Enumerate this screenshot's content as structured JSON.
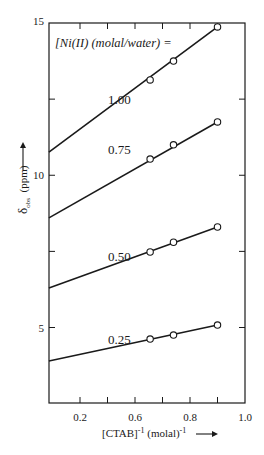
{
  "chart_data": {
    "type": "line",
    "title": "",
    "legend_title": "[Ni(II) (molal/water) =",
    "xlabel": "[CTAB]⁻¹ (molal)⁻¹",
    "xlabel_parts": {
      "main": "[CTAB]",
      "sup1": "-1",
      "unit": " (molal)",
      "sup2": "-1",
      "arrow": "→"
    },
    "ylabel": "δobs (ppm)",
    "ylabel_parts": {
      "symbol": "δ",
      "sub": "obs",
      "unit": " (ppm)",
      "arrow": "→"
    },
    "xlim": [
      0.287,
      1.0
    ],
    "ylim": [
      2.53,
      15
    ],
    "x_ticks": [
      {
        "pos": 0.4,
        "label": "0.2"
      },
      {
        "pos": 0.5,
        "label": ""
      },
      {
        "pos": 0.6,
        "label": "0.6"
      },
      {
        "pos": 0.7,
        "label": ""
      },
      {
        "pos": 0.8,
        "label": "0.8"
      },
      {
        "pos": 0.9,
        "label": ""
      },
      {
        "pos": 1.0,
        "label": "1.0"
      }
    ],
    "y_ticks": [
      {
        "pos": 15,
        "label": "15"
      },
      {
        "pos": 12.5,
        "label": ""
      },
      {
        "pos": 10,
        "label": "10"
      },
      {
        "pos": 7.5,
        "label": ""
      },
      {
        "pos": 5,
        "label": "5"
      }
    ],
    "grid": false,
    "legend_position": "top-left inside",
    "series": [
      {
        "name": "1.00",
        "label_x": 0.55,
        "label_y": 12.35,
        "fit_x": [
          0.287,
          0.9
        ],
        "fit_y": [
          10.76,
          14.87
        ],
        "points_x": [
          0.655,
          0.74,
          0.9
        ],
        "points_y": [
          13.13,
          13.75,
          14.87
        ]
      },
      {
        "name": "0.75",
        "label_x": 0.55,
        "label_y": 10.7,
        "fit_x": [
          0.287,
          0.9
        ],
        "fit_y": [
          8.6,
          11.75
        ],
        "points_x": [
          0.655,
          0.74,
          0.9
        ],
        "points_y": [
          10.53,
          11.0,
          11.75
        ]
      },
      {
        "name": "0.50",
        "label_x": 0.55,
        "label_y": 7.2,
        "fit_x": [
          0.287,
          0.9
        ],
        "fit_y": [
          6.3,
          8.3
        ],
        "points_x": [
          0.655,
          0.74,
          0.9
        ],
        "points_y": [
          7.48,
          7.8,
          8.3
        ]
      },
      {
        "name": "0.25",
        "label_x": 0.55,
        "label_y": 4.45,
        "fit_x": [
          0.287,
          0.9
        ],
        "fit_y": [
          3.9,
          5.08
        ],
        "points_x": [
          0.655,
          0.74,
          0.9
        ],
        "points_y": [
          4.62,
          4.75,
          5.08
        ]
      }
    ]
  }
}
